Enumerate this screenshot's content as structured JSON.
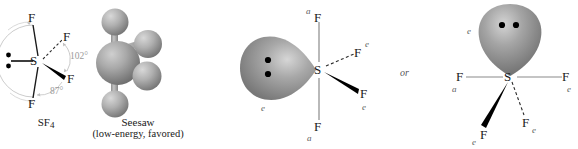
{
  "figure": {
    "background_color": "#ffffff",
    "bond_color": "#1a1a1a",
    "guide_color": "#b4b4b4",
    "angle_text_color": "#9a9a9a",
    "tag_color": "#5e5e5e",
    "lobe_color": "#8e8e8e",
    "sphere_color": "#a6a6a6"
  },
  "panels": {
    "lewis": {
      "name": "SF4 line structure with bond angles",
      "center_atom": "S",
      "ligands": [
        {
          "label": "F",
          "position": "top",
          "bond": "plain"
        },
        {
          "label": "F",
          "position": "bottom",
          "bond": "plain"
        },
        {
          "label": "F",
          "position": "upper-right",
          "bond": "dashed"
        },
        {
          "label": "F",
          "position": "lower-right",
          "bond": "wedge"
        }
      ],
      "lone_pair": {
        "dots": 2,
        "position": "left"
      },
      "angles": [
        {
          "value": "102°",
          "between": "equatorial F-S-F"
        },
        {
          "value": "87°",
          "between": "axial F-S-F"
        }
      ],
      "caption": "SF",
      "caption_subscript": "4"
    },
    "ball_model": {
      "name": "SF4 ball-and-stick seesaw model",
      "center_atom": "S",
      "ligand_count": 4,
      "caption_line1": "Seesaw",
      "caption_line2": "(low-energy, favored)"
    },
    "middle": {
      "name": "SF4 with equatorial lone pair pointing left",
      "center_atom": "S",
      "lone_pair_dots": 2,
      "lone_pair_tag": "e",
      "ligands": [
        {
          "label": "F",
          "tag": "a",
          "position": "top",
          "bond": "plain"
        },
        {
          "label": "F",
          "tag": "a",
          "position": "bottom",
          "bond": "plain"
        },
        {
          "label": "F",
          "tag": "e",
          "position": "upper-right",
          "bond": "dashed"
        },
        {
          "label": "F",
          "tag": "e",
          "position": "lower-right",
          "bond": "wedge"
        }
      ]
    },
    "connector": {
      "text": "or"
    },
    "right": {
      "name": "SF4 with equatorial lone pair pointing up",
      "center_atom": "S",
      "lone_pair_dots": 2,
      "lone_pair_tag": "e",
      "ligands": [
        {
          "label": "F",
          "tag": "a",
          "position": "left",
          "bond": "plain"
        },
        {
          "label": "F",
          "tag": "e",
          "position": "right",
          "bond": "plain"
        },
        {
          "label": "F",
          "tag": "e",
          "position": "lower-left",
          "bond": "wedge"
        },
        {
          "label": "F",
          "tag": "e",
          "position": "lower-right",
          "bond": "dashed"
        }
      ]
    }
  }
}
